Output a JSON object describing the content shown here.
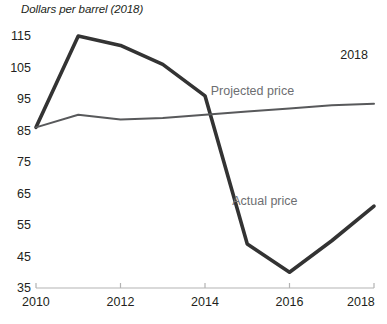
{
  "chart_data": {
    "type": "line",
    "title": "Dollars per barrel (2018)",
    "xlabel": "",
    "ylabel": "",
    "x": [
      2010,
      2011,
      2012,
      2013,
      2014,
      2015,
      2016,
      2017,
      2018
    ],
    "xticks": [
      "2010",
      "2012",
      "2014",
      "2016",
      "2018"
    ],
    "xtick_values": [
      2010,
      2012,
      2014,
      2016,
      2018
    ],
    "yticks": [
      "35",
      "45",
      "55",
      "65",
      "75",
      "85",
      "95",
      "105",
      "115"
    ],
    "ytick_values": [
      35,
      45,
      55,
      65,
      75,
      85,
      95,
      105,
      115
    ],
    "xlim": [
      2010,
      2018
    ],
    "ylim": [
      35,
      115
    ],
    "grid": false,
    "legend_position": "inline-annotation",
    "series": [
      {
        "name": "Actual price",
        "color": "#333333",
        "width": 3.6,
        "values": [
          86,
          115,
          112,
          106,
          96,
          49,
          40,
          50,
          61
        ]
      },
      {
        "name": "Projected price",
        "color": "#58595b",
        "width": 2.0,
        "values": [
          86,
          90,
          88.5,
          89,
          90,
          91,
          92,
          93,
          93.5
        ]
      }
    ],
    "annotations": [
      {
        "text": "2018",
        "x": 2017.2,
        "y": 109
      },
      {
        "text": "Projected price",
        "x": 2016.1,
        "y": 97.5
      },
      {
        "text": "Actual price",
        "x": 2016.3,
        "y": 62.5
      }
    ]
  },
  "labels": {
    "title": "Dollars per barrel (2018)",
    "annotation_year": "2018",
    "projected_series_label": "Projected price",
    "actual_series_label": "Actual price"
  }
}
